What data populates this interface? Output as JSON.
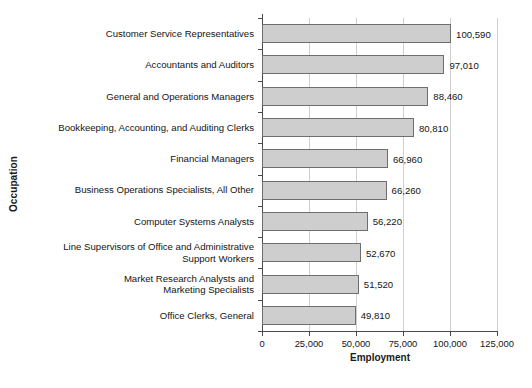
{
  "chart_data": {
    "type": "bar",
    "orientation": "horizontal",
    "title": "",
    "xlabel": "Employment",
    "ylabel": "Occupation",
    "xlim": [
      0,
      125000
    ],
    "xticks": [
      0,
      25000,
      50000,
      75000,
      100000,
      125000
    ],
    "xtick_labels": [
      "0",
      "25,000",
      "50,000",
      "75,000",
      "100,000",
      "125,000"
    ],
    "grid": true,
    "grid_axis": "x",
    "legend": false,
    "bar_fill_color": "#cecece",
    "bar_edge_color": "#6e6e6e",
    "categories": [
      "Customer Service Representatives",
      "Accountants and Auditors",
      "General and Operations Managers",
      "Bookkeeping, Accounting, and Auditing Clerks",
      "Financial Managers",
      "Business Operations Specialists, All Other",
      "Computer Systems Analysts",
      "Line Supervisors of Office and Administrative\nSupport Workers",
      "Market Research Analysts and\nMarketing Specialists",
      "Office Clerks, General"
    ],
    "values": [
      100590,
      97010,
      88460,
      80810,
      66960,
      66260,
      56220,
      52670,
      51520,
      49810
    ],
    "value_labels": [
      "100,590",
      "97,010",
      "88,460",
      "80,810",
      "66,960",
      "66,260",
      "56,220",
      "52,670",
      "51,520",
      "49,810"
    ]
  }
}
